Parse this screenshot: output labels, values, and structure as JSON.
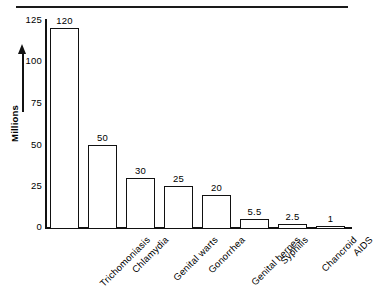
{
  "chart_data": {
    "type": "bar",
    "title": "",
    "subtitle": "",
    "xlabel": "",
    "ylabel": "Millions",
    "categories": [
      "Trichomoniasis",
      "Chlamydia",
      "Genital warts",
      "Gonorrhea",
      "Genital herpes",
      "Syphilis",
      "Chancroid",
      "AIDS"
    ],
    "values": [
      120,
      50,
      30,
      25,
      20,
      5.5,
      2.5,
      1
    ],
    "value_labels": [
      "120",
      "50",
      "30",
      "25",
      "20",
      "5.5",
      "2.5",
      "1"
    ],
    "ylim": [
      0,
      125
    ],
    "yticks": [
      0,
      25,
      50,
      75,
      100,
      125
    ],
    "ytick_labels": [
      "0",
      "25",
      "50",
      "75",
      "100",
      "125"
    ],
    "grid": false,
    "legend": false,
    "bar_fill_color": "#ffffff",
    "bar_edge_color": "#111111",
    "background_color": "#ffffff",
    "axis_color": "#111111"
  }
}
